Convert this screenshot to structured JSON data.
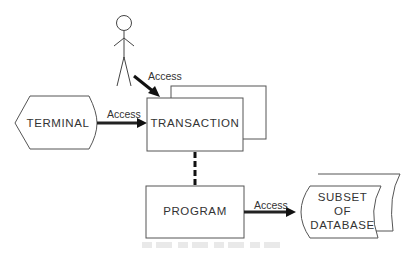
{
  "diagram": {
    "actor": {
      "name": "user"
    },
    "nodes": {
      "terminal": {
        "label": "TERMINAL"
      },
      "transaction": {
        "label": "TRANSACTION"
      },
      "program": {
        "label": "PROGRAM"
      },
      "database": {
        "line1": "SUBSET",
        "line2": "OF",
        "line3": "DATABASE"
      }
    },
    "edges": {
      "user_to_transaction": {
        "label": "Access"
      },
      "terminal_to_transaction": {
        "label": "Access"
      },
      "program_to_database": {
        "label": "Access"
      }
    },
    "colors": {
      "line": "#3a3a3a",
      "arrow": "#111111",
      "background": "#ffffff"
    }
  }
}
